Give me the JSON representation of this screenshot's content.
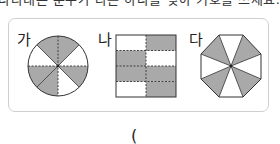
{
  "question": {
    "cropped_text": "나타내는 분수가 다른 하나를 찾아 기호를 쓰세요."
  },
  "figures": [
    {
      "id": "ga",
      "label": "가",
      "shape": "circle",
      "divisions": 8,
      "shaded_sectors_clockwise_from_top": [
        true,
        false,
        true,
        false,
        true,
        true,
        false,
        true
      ]
    },
    {
      "id": "na",
      "label": "나",
      "shape": "square",
      "rows": 4,
      "cols": 2,
      "shaded_cells": [
        [
          false,
          true
        ],
        [
          true,
          false
        ],
        [
          true,
          true
        ],
        [
          false,
          true
        ]
      ]
    },
    {
      "id": "da",
      "label": "다",
      "shape": "octagon",
      "divisions": 8,
      "shaded_triangles": [
        "top-right",
        "bottom-right",
        "bottom-left",
        "top-left"
      ]
    }
  ],
  "answer": {
    "open_paren": "("
  },
  "colors": {
    "shade": "#a9a9a9",
    "line": "#333333",
    "panel_border": "#cfcfcf"
  }
}
